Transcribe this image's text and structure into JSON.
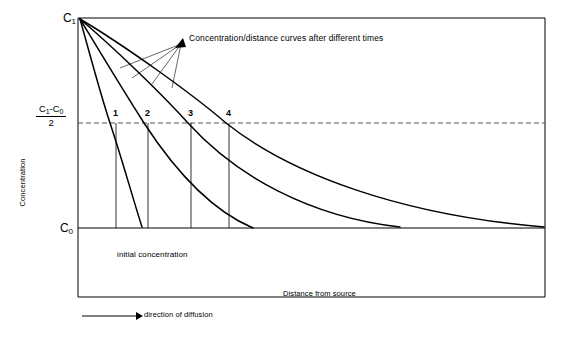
{
  "figure": {
    "width": 574,
    "height": 346,
    "background": "#ffffff",
    "stroke_color": "#000000",
    "dashed_color": "#555555"
  },
  "axes": {
    "y_title": "Concentration",
    "x_title": "Distance from source",
    "top_label": "C",
    "top_label_sub": "1",
    "bottom_label": "C",
    "bottom_label_sub": "0",
    "half_value_numerator": "C",
    "half_value_numerator_sub1": "1",
    "half_value_numerator_mid": "-C",
    "half_value_numerator_sub2": "0",
    "half_value_denominator": "2"
  },
  "annotations": {
    "curves_note": "Concentration/distance curves after different times",
    "initial_concentration": "initial concentration",
    "legend_direction": "direction of diffusion"
  },
  "curve_numbers": [
    {
      "label": "1",
      "x": 116,
      "y": 113
    },
    {
      "label": "2",
      "x": 148,
      "y": 113
    },
    {
      "label": "3",
      "x": 191,
      "y": 113
    },
    {
      "label": "4",
      "x": 229,
      "y": 113
    }
  ],
  "chart_data": {
    "type": "line",
    "title": "",
    "xlabel": "Distance from source",
    "ylabel": "Concentration",
    "legend_position": "none",
    "grid": false,
    "axis_pixel_box": {
      "left": 78,
      "top": 18,
      "right": 545,
      "bottom": 297
    },
    "y_levels": {
      "C1_pixel_y": 18,
      "half_pixel_y": 123,
      "C0_pixel_y": 228
    },
    "series": [
      {
        "name": "1",
        "crossing_half_x": 116,
        "path": "M 80,19 C 92,62 101,96 110,123 C 121,156 131,192 142,227"
      },
      {
        "name": "2",
        "crossing_half_x": 148,
        "path": "M 80,19 C 100,52 124,92 144,123 C 172,166 210,210 253,228"
      },
      {
        "name": "3",
        "crossing_half_x": 191,
        "path": "M 80,19 C 112,46 160,92 188,123 C 236,176 310,217 400,227"
      },
      {
        "name": "4",
        "crossing_half_x": 229,
        "path": "M 80,19 C 122,44 190,92 226,123 C 290,174 400,215 544,227"
      }
    ],
    "vertical_markers": [
      116,
      148,
      191,
      229
    ],
    "dashed_level_label": "(C1-C0)/2"
  }
}
